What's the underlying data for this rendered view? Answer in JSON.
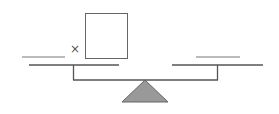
{
  "diagram": {
    "type": "balance-scale",
    "left_pan": {
      "blank": "",
      "operator": "×",
      "box": ""
    },
    "right_pan": {
      "blank": ""
    },
    "colors": {
      "line": "#555555",
      "fulcrum": "#999999"
    }
  }
}
